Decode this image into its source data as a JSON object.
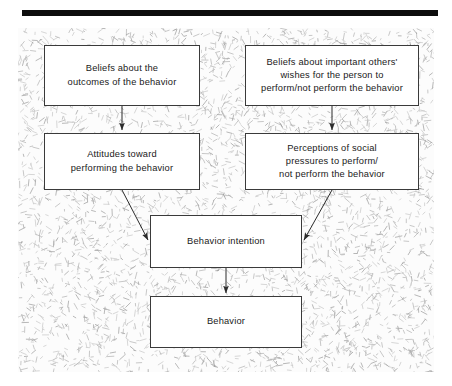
{
  "figure": {
    "header_rule_color": "#0d0d0d",
    "background_color": "#fbfbfb",
    "node_border_color": "#3a3a3a",
    "arrow_color": "#2b2b2b"
  },
  "nodes": {
    "belief_outcomes": {
      "label": "Beliefs about the\noutcomes of the behavior"
    },
    "belief_others": {
      "label": "Beliefs about important others'\nwishes for the person to\nperform/not perform the behavior"
    },
    "attitudes": {
      "label": "Attitudes toward\nperforming the behavior"
    },
    "perceptions": {
      "label": "Perceptions of social\npressures to perform/\nnot perform the behavior"
    },
    "intention": {
      "label": "Behavior intention"
    },
    "behavior": {
      "label": "Behavior"
    }
  },
  "chart_data": {
    "type": "diagram",
    "diagram_kind": "flowchart",
    "nodes": [
      {
        "id": "belief_outcomes",
        "label": "Beliefs about the outcomes of the behavior",
        "column": "left",
        "row": 1
      },
      {
        "id": "belief_others",
        "label": "Beliefs about important others' wishes for the person to perform/not perform the behavior",
        "column": "right",
        "row": 1
      },
      {
        "id": "attitudes",
        "label": "Attitudes toward performing the behavior",
        "column": "left",
        "row": 2
      },
      {
        "id": "perceptions",
        "label": "Perceptions of social pressures to perform/not perform the behavior",
        "column": "right",
        "row": 2
      },
      {
        "id": "intention",
        "label": "Behavior intention",
        "column": "center",
        "row": 3
      },
      {
        "id": "behavior",
        "label": "Behavior",
        "column": "center",
        "row": 4
      }
    ],
    "edges": [
      {
        "from": "belief_outcomes",
        "to": "attitudes",
        "style": "straight-down"
      },
      {
        "from": "belief_others",
        "to": "perceptions",
        "style": "straight-down"
      },
      {
        "from": "attitudes",
        "to": "intention",
        "style": "diagonal"
      },
      {
        "from": "perceptions",
        "to": "intention",
        "style": "diagonal"
      },
      {
        "from": "intention",
        "to": "behavior",
        "style": "straight-down"
      }
    ]
  }
}
